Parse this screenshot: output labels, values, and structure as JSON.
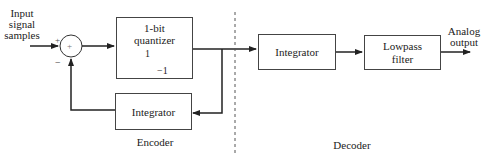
{
  "diagram": {
    "input_label": [
      "Input",
      "signal",
      "samples"
    ],
    "summer": {
      "symbol": "+",
      "plus_sign": "+",
      "minus_sign": "−"
    },
    "quantizer": {
      "title_line1": "1-bit",
      "title_line2": "quantizer",
      "level_high": "1",
      "level_low": "−1"
    },
    "feedback_integrator": {
      "label": "Integrator"
    },
    "decoder_integrator": {
      "label": "Integrator"
    },
    "lowpass_filter": {
      "line1": "Lowpass",
      "line2": "filter"
    },
    "output_label": [
      "Analog",
      "output"
    ],
    "section_labels": {
      "encoder": "Encoder",
      "decoder": "Decoder"
    }
  }
}
